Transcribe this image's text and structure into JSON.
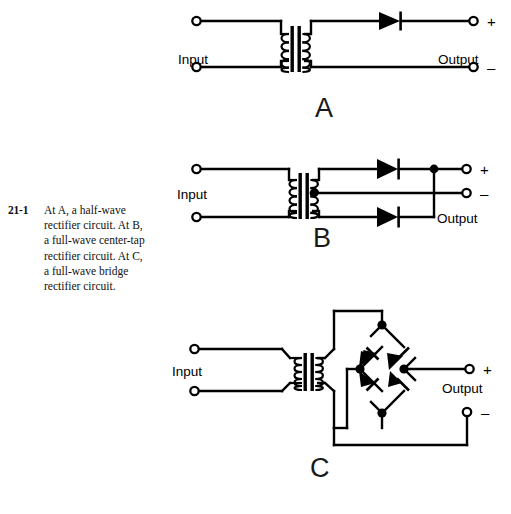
{
  "figure": {
    "number": "21-1",
    "caption_lines": [
      "At A, a half-wave",
      "rectifier circuit. At B,",
      "a full-wave center-tap",
      "rectifier circuit. At C,",
      "a full-wave bridge",
      "rectifier circuit."
    ]
  },
  "colors": {
    "ink": "#000000",
    "background": "#ffffff",
    "caption_ink": "#111111"
  },
  "circuits": [
    {
      "id": "A",
      "letter": "A",
      "title": "half-wave rectifier circuit",
      "input_label": "Input",
      "output_label": "Output",
      "plus_sign": "+",
      "minus_sign": "–",
      "components": {
        "transformer": 1,
        "diodes": 1,
        "input_terminals": 2,
        "output_terminals": 2,
        "junction_dots": 0
      }
    },
    {
      "id": "B",
      "letter": "B",
      "title": "full-wave center-tap rectifier circuit",
      "input_label": "Input",
      "output_label": "Output",
      "plus_sign": "+",
      "minus_sign": "–",
      "components": {
        "transformer": 1,
        "diodes": 2,
        "input_terminals": 2,
        "output_terminals": 2,
        "junction_dots": 2
      }
    },
    {
      "id": "C",
      "letter": "C",
      "title": "full-wave bridge rectifier circuit",
      "input_label": "Input",
      "output_label": "Output",
      "plus_sign": "+",
      "minus_sign": "–",
      "components": {
        "transformer": 1,
        "diodes": 4,
        "input_terminals": 2,
        "output_terminals": 2,
        "junction_dots": 4
      }
    }
  ]
}
